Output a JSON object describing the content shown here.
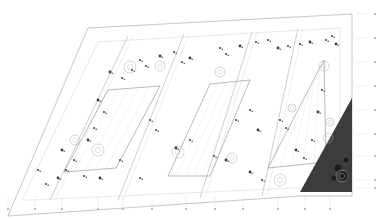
{
  "drawing": {
    "type": "architectural-site-plan",
    "colors": {
      "background": "#ffffff",
      "line": "#b8b8b8",
      "line_dark": "#8a8a8a",
      "tree": "#3a3a3a",
      "hatch_fill": "#3c3c3c",
      "hatch_dot": "#1e1e1e"
    },
    "site_outline": [
      [
        8,
        216
      ],
      [
        88,
        28
      ],
      [
        352,
        14
      ],
      [
        352,
        196
      ],
      [
        300,
        196
      ]
    ],
    "inner_boundary": [
      [
        22,
        200
      ],
      [
        98,
        42
      ],
      [
        340,
        28
      ],
      [
        340,
        186
      ],
      [
        30,
        200
      ]
    ],
    "hatched_corner": [
      [
        300,
        192
      ],
      [
        352,
        98
      ],
      [
        352,
        192
      ]
    ],
    "strip_dividers": [
      [
        [
          50,
          200
        ],
        [
          128,
          36
        ]
      ],
      [
        [
          118,
          200
        ],
        [
          184,
          34
        ]
      ],
      [
        [
          200,
          198
        ],
        [
          252,
          32
        ]
      ],
      [
        [
          262,
          196
        ],
        [
          298,
          28
        ]
      ]
    ],
    "courtyards": [
      [
        [
          64,
          172
        ],
        [
          108,
          90
        ],
        [
          160,
          86
        ],
        [
          116,
          168
        ]
      ],
      [
        [
          168,
          176
        ],
        [
          210,
          84
        ],
        [
          250,
          80
        ],
        [
          210,
          176
        ]
      ],
      [
        [
          268,
          168
        ],
        [
          300,
          106
        ],
        [
          324,
          60
        ],
        [
          326,
          162
        ]
      ]
    ],
    "grid_axes": {
      "bottom_ticks_x": [
        8,
        35,
        62,
        98,
        123,
        152,
        186,
        215,
        243,
        278,
        305,
        330
      ],
      "bottom_ticks_y": 207,
      "right_ticks_y": [
        14,
        38,
        62,
        86,
        110,
        134,
        156,
        180,
        188
      ],
      "right_ticks_x": 372
    },
    "trees": [
      [
        110,
        72
      ],
      [
        122,
        78
      ],
      [
        132,
        70
      ],
      [
        98,
        100
      ],
      [
        104,
        112
      ],
      [
        94,
        128
      ],
      [
        88,
        140
      ],
      [
        74,
        160
      ],
      [
        66,
        170
      ],
      [
        58,
        178
      ],
      [
        140,
        60
      ],
      [
        146,
        66
      ],
      [
        160,
        56
      ],
      [
        174,
        52
      ],
      [
        182,
        62
      ],
      [
        190,
        58
      ],
      [
        220,
        48
      ],
      [
        226,
        54
      ],
      [
        240,
        46
      ],
      [
        256,
        42
      ],
      [
        268,
        40
      ],
      [
        278,
        48
      ],
      [
        288,
        46
      ],
      [
        300,
        44
      ],
      [
        310,
        42
      ],
      [
        326,
        40
      ],
      [
        332,
        36
      ],
      [
        336,
        44
      ],
      [
        150,
        120
      ],
      [
        156,
        130
      ],
      [
        176,
        148
      ],
      [
        190,
        140
      ],
      [
        214,
        156
      ],
      [
        226,
        160
      ],
      [
        236,
        120
      ],
      [
        250,
        110
      ],
      [
        258,
        130
      ],
      [
        280,
        120
      ],
      [
        286,
        128
      ],
      [
        296,
        150
      ],
      [
        304,
        158
      ],
      [
        312,
        140
      ],
      [
        318,
        112
      ],
      [
        322,
        90
      ],
      [
        84,
        176
      ],
      [
        100,
        178
      ],
      [
        46,
        184
      ],
      [
        38,
        170
      ],
      [
        62,
        150
      ],
      [
        120,
        160
      ],
      [
        140,
        178
      ],
      [
        250,
        172
      ],
      [
        262,
        180
      ]
    ],
    "round_features": [
      [
        130,
        67,
        6
      ],
      [
        160,
        66,
        5
      ],
      [
        75,
        140,
        5
      ],
      [
        98,
        150,
        6
      ],
      [
        178,
        152,
        6
      ],
      [
        232,
        158,
        5
      ],
      [
        280,
        180,
        6
      ],
      [
        324,
        66,
        5
      ],
      [
        330,
        122,
        4
      ],
      [
        328,
        138,
        5
      ],
      [
        342,
        176,
        6
      ],
      [
        220,
        72,
        5
      ],
      [
        292,
        108,
        4
      ]
    ],
    "hatch_trees": [
      [
        338,
        168,
        4
      ],
      [
        344,
        176,
        5
      ],
      [
        334,
        178,
        3
      ],
      [
        346,
        160,
        3
      ]
    ]
  }
}
